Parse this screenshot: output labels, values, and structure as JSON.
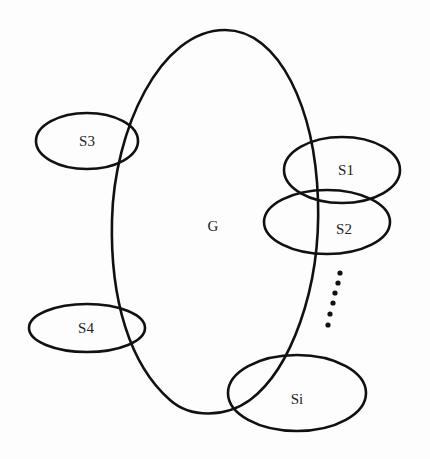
{
  "diagram": {
    "main_set": {
      "label": "G"
    },
    "subsets": [
      {
        "id": "s3",
        "label": "S3"
      },
      {
        "id": "s1",
        "label": "S1"
      },
      {
        "id": "s2",
        "label": "S2"
      },
      {
        "id": "s4",
        "label": "S4"
      },
      {
        "id": "si",
        "label": "Si"
      }
    ],
    "ellipsis_dots": 6,
    "colors": {
      "stroke": "#111111",
      "background": "#fdfdfd",
      "text": "#222222"
    }
  }
}
